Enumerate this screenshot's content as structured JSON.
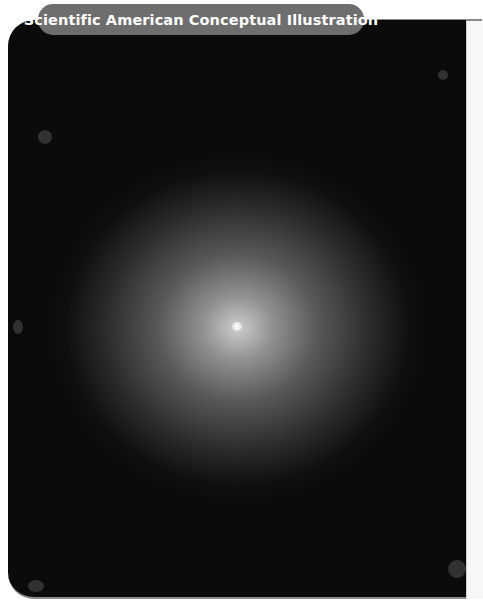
{
  "header": {
    "label": "Scientific American Conceptual Illustration"
  },
  "illustration": {
    "description": "Glowing diffuse sphere with bright central point on black starfield",
    "background_color": "#0b0b0b",
    "glow_color": "#d7d7d7",
    "label_background_color": "#6e6e6e"
  }
}
